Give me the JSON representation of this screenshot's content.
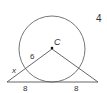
{
  "problem": {
    "number": "4"
  },
  "diagram": {
    "center_label": "C",
    "radius_label": "6",
    "secant_external_label": "x",
    "base_left_label": "8",
    "base_right_label": "8",
    "colors": {
      "stroke": "#555555",
      "text": "#333333"
    }
  }
}
